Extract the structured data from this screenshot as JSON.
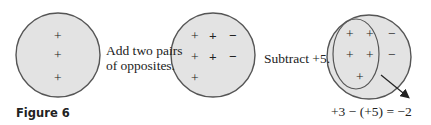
{
  "figure_label": "Figure 6",
  "step1_label_line1": "Add two pairs",
  "step1_label_line2": "of opposites.",
  "step2_label": "Subtract +5.",
  "equation": "+3 − (+5) = −2",
  "circles": [
    {
      "name": "initial",
      "symbols": [
        "+",
        "+",
        "+"
      ]
    },
    {
      "name": "after-adding-opposites",
      "symbols": [
        "+",
        "+",
        "−",
        "+",
        "+",
        "−",
        "+"
      ]
    },
    {
      "name": "after-subtracting",
      "circled": [
        "+",
        "+",
        "+",
        "+",
        "+"
      ],
      "remaining": [
        "−",
        "−"
      ]
    }
  ],
  "colors": {
    "fill": "#e3e3e3",
    "stroke": "#555555",
    "text": "#222222"
  }
}
